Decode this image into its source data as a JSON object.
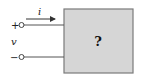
{
  "diagram": {
    "type": "two-terminal circuit element",
    "current_label": "i",
    "voltage_label": "v",
    "plus_sign": "+",
    "minus_sign": "−",
    "box_label": "?",
    "colors": {
      "box_fill": "#d6d6d6",
      "box_stroke": "#7a7a7a",
      "wire": "#555555"
    }
  }
}
